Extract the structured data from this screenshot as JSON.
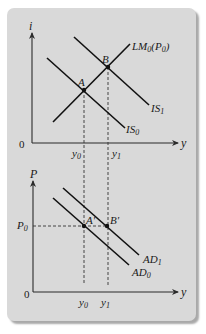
{
  "figure": {
    "background_color": "#d9d9d9",
    "line_color": "#111111"
  },
  "top_panel": {
    "y_axis_label": "i",
    "x_axis_label": "y",
    "origin_label": "0",
    "curves": [
      {
        "name": "LM",
        "label": "LM",
        "sub": "0",
        "suffix_open": "(P",
        "suffix_sub": "0",
        "suffix_close": ")"
      },
      {
        "name": "IS0",
        "label": "IS",
        "sub": "0"
      },
      {
        "name": "IS1",
        "label": "IS",
        "sub": "1"
      }
    ],
    "points": [
      {
        "label": "A"
      },
      {
        "label": "B"
      }
    ],
    "x_ticks": [
      {
        "label": "y",
        "sub": "0"
      },
      {
        "label": "y",
        "sub": "1"
      }
    ]
  },
  "bottom_panel": {
    "y_axis_label": "P",
    "x_axis_label": "y",
    "origin_label": "0",
    "y_tick": {
      "label": "P",
      "sub": "0"
    },
    "curves": [
      {
        "name": "AD0",
        "label": "AD",
        "sub": "0"
      },
      {
        "name": "AD1",
        "label": "AD",
        "sub": "1"
      }
    ],
    "points": [
      {
        "label": "A'"
      },
      {
        "label": "B'"
      }
    ],
    "x_ticks": [
      {
        "label": "y",
        "sub": "0"
      },
      {
        "label": "y",
        "sub": "1"
      }
    ]
  }
}
